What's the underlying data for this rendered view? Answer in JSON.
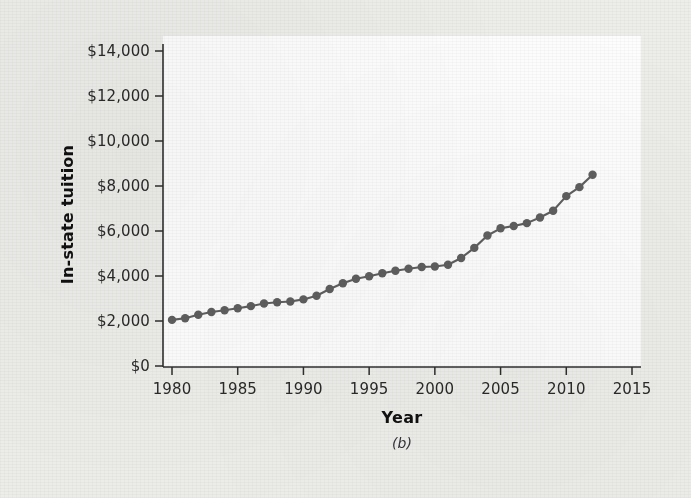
{
  "chart_data": {
    "type": "line",
    "title": "",
    "caption": "(b)",
    "xlabel": "Year",
    "ylabel": "In-state tuition",
    "xlim": [
      1980,
      2015
    ],
    "ylim": [
      0,
      14000
    ],
    "grid": false,
    "legend": "none",
    "marker": "filled-circle",
    "series_color": "#5f5f5f",
    "x_tick_labels": [
      "1980",
      "1985",
      "1990",
      "1995",
      "2000",
      "2005",
      "2010",
      "2015"
    ],
    "x_tick_values": [
      1980,
      1985,
      1990,
      1995,
      2000,
      2005,
      2010,
      2015
    ],
    "y_tick_labels": [
      "$0",
      "$2,000",
      "$4,000",
      "$6,000",
      "$8,000",
      "$10,000",
      "$12,000",
      "$14,000"
    ],
    "y_tick_values": [
      0,
      2000,
      4000,
      6000,
      8000,
      10000,
      12000,
      14000
    ],
    "x": [
      1980,
      1981,
      1982,
      1983,
      1984,
      1985,
      1986,
      1987,
      1988,
      1989,
      1990,
      1991,
      1992,
      1993,
      1994,
      1995,
      1996,
      1997,
      1998,
      1999,
      2000,
      2001,
      2002,
      2003,
      2004,
      2005,
      2006,
      2007,
      2008,
      2009,
      2010,
      2011,
      2012
    ],
    "values": [
      2050,
      2120,
      2280,
      2400,
      2480,
      2570,
      2660,
      2780,
      2830,
      2870,
      2960,
      3120,
      3420,
      3680,
      3880,
      3990,
      4120,
      4230,
      4320,
      4400,
      4420,
      4500,
      4800,
      5250,
      5800,
      6120,
      6220,
      6350,
      6600,
      6900,
      7550,
      7950,
      8500
    ]
  },
  "axis": {
    "y_title": "In-state tuition",
    "x_title": "Year"
  },
  "figure": {
    "panel_label": "(b)"
  }
}
